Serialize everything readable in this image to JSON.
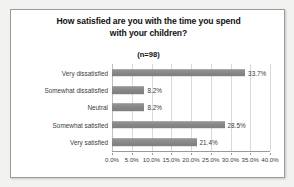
{
  "chart_data": {
    "type": "bar",
    "orientation": "horizontal",
    "title": "How satisfied are you with the time you spend with your children?",
    "title_lines": [
      "How satisfied are you with the time you spend",
      "with your children?"
    ],
    "subtitle": "(n=98)",
    "sample_size": 98,
    "categories": [
      "Very dissatisfied",
      "Somewhat dissatisfied",
      "Neutral",
      "Somewhat satisfied",
      "Very satisfied"
    ],
    "values": [
      33.7,
      8.2,
      8.2,
      28.5,
      21.4
    ],
    "data_labels": [
      "33.7%",
      "8.2%",
      "8.2%",
      "28.5%",
      "21.4%"
    ],
    "xlabel": "",
    "ylabel": "",
    "xlim": [
      0,
      40
    ],
    "xticks": [
      0,
      5,
      10,
      15,
      20,
      25,
      30,
      35,
      40
    ],
    "xtick_labels": [
      "0.0%",
      "5.0%",
      "10.0%",
      "15.0%",
      "20.0%",
      "25.0%",
      "30.0%",
      "35.0%",
      "40.0%"
    ],
    "grid": true,
    "grid_axis": "x",
    "legend": false,
    "bar_color": "#8c8c8c",
    "grid_color": "#d9d9d9",
    "axis_color": "#9a9a9a",
    "text_color": "#3c3c3c",
    "background_color": "#ffffff"
  }
}
